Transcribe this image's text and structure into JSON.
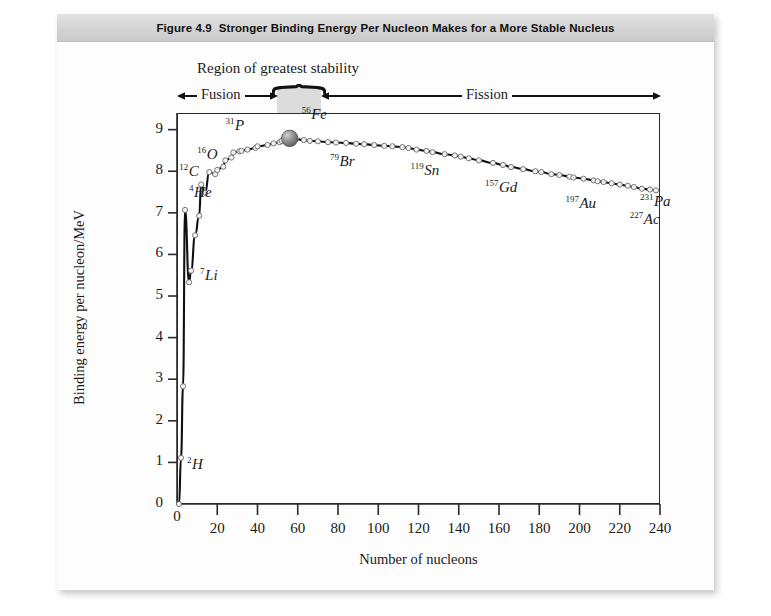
{
  "figure": {
    "number": "Figure 4.9",
    "title": "Stronger Binding Energy Per Nucleon Makes for a More Stable Nucleus"
  },
  "annotations": {
    "stability_region_label": "Region of greatest stability",
    "fusion_label": "Fusion",
    "fission_label": "Fission",
    "band_start": 52,
    "band_end": 74
  },
  "chart_data": {
    "type": "line",
    "title": "Stronger Binding Energy Per Nucleon Makes for a More Stable Nucleus",
    "xlabel": "Number of nucleons",
    "ylabel": "Binding energy per nucleon/MeV",
    "xlim": [
      0,
      240
    ],
    "ylim": [
      0,
      9.4
    ],
    "xticks": [
      0,
      20,
      40,
      60,
      80,
      100,
      120,
      140,
      160,
      180,
      200,
      220,
      240
    ],
    "yticks": [
      0,
      1,
      2,
      3,
      4,
      5,
      6,
      7,
      8,
      9
    ],
    "grid": false,
    "legend": "none",
    "series": [
      {
        "name": "Binding energy per nucleon",
        "x": [
          1,
          2,
          3,
          4,
          6,
          7,
          9,
          11,
          12,
          14,
          16,
          19,
          20,
          23,
          24,
          27,
          28,
          31,
          32,
          35,
          39,
          40,
          45,
          48,
          51,
          52,
          56,
          59,
          63,
          66,
          70,
          75,
          79,
          84,
          89,
          93,
          98,
          103,
          107,
          112,
          115,
          119,
          124,
          127,
          133,
          138,
          141,
          145,
          150,
          157,
          162,
          166,
          172,
          178,
          181,
          186,
          190,
          195,
          197,
          202,
          207,
          209,
          212,
          216,
          220,
          224,
          227,
          231,
          235,
          238
        ],
        "y": [
          0.0,
          1.11,
          2.83,
          7.07,
          5.33,
          5.61,
          6.46,
          6.93,
          7.68,
          7.48,
          7.98,
          7.93,
          8.03,
          8.11,
          8.26,
          8.33,
          8.45,
          8.48,
          8.49,
          8.52,
          8.56,
          8.6,
          8.63,
          8.67,
          8.7,
          8.73,
          8.79,
          8.77,
          8.75,
          8.73,
          8.72,
          8.7,
          8.69,
          8.68,
          8.66,
          8.65,
          8.63,
          8.61,
          8.6,
          8.58,
          8.56,
          8.52,
          8.49,
          8.46,
          8.41,
          8.38,
          8.35,
          8.31,
          8.26,
          8.2,
          8.15,
          8.1,
          8.05,
          8.0,
          7.98,
          7.93,
          7.91,
          7.87,
          7.85,
          7.82,
          7.78,
          7.76,
          7.74,
          7.71,
          7.68,
          7.65,
          7.62,
          7.58,
          7.56,
          7.54
        ]
      }
    ],
    "labeled_points": [
      {
        "mass": "2",
        "symbol": "H",
        "x": 2,
        "y": 1.11
      },
      {
        "mass": "4",
        "symbol": "He",
        "x": 4,
        "y": 7.07
      },
      {
        "mass": "7",
        "symbol": "Li",
        "x": 7,
        "y": 5.61
      },
      {
        "mass": "12",
        "symbol": "C",
        "x": 12,
        "y": 7.68
      },
      {
        "mass": "16",
        "symbol": "O",
        "x": 16,
        "y": 7.98
      },
      {
        "mass": "31",
        "symbol": "P",
        "x": 31,
        "y": 8.48
      },
      {
        "mass": "56",
        "symbol": "Fe",
        "x": 56,
        "y": 8.79
      },
      {
        "mass": "79",
        "symbol": "Br",
        "x": 79,
        "y": 8.69
      },
      {
        "mass": "119",
        "symbol": "Sn",
        "x": 119,
        "y": 8.52
      },
      {
        "mass": "157",
        "symbol": "Gd",
        "x": 157,
        "y": 8.2
      },
      {
        "mass": "197",
        "symbol": "Au",
        "x": 197,
        "y": 7.85
      },
      {
        "mass": "227",
        "symbol": "Ac",
        "x": 227,
        "y": 7.62
      },
      {
        "mass": "231",
        "symbol": "Pa",
        "x": 231,
        "y": 7.58
      }
    ],
    "highlight_point": {
      "mass": "56",
      "symbol": "Fe",
      "x": 56,
      "y": 8.79
    },
    "colors": {
      "curve": "#101010",
      "marker_fill": "#f2f2f2",
      "marker_stroke": "#6a6a6a",
      "band": "#d9d9d9",
      "highlight": "#6f6f6f"
    }
  },
  "ytick_labels": [
    "0",
    "1",
    "2",
    "3",
    "4",
    "5",
    "6",
    "7",
    "8",
    "9"
  ],
  "xtick_labels": [
    "0",
    "20",
    "40",
    "60",
    "80",
    "100",
    "120",
    "140",
    "160",
    "180",
    "200",
    "220",
    "240"
  ]
}
